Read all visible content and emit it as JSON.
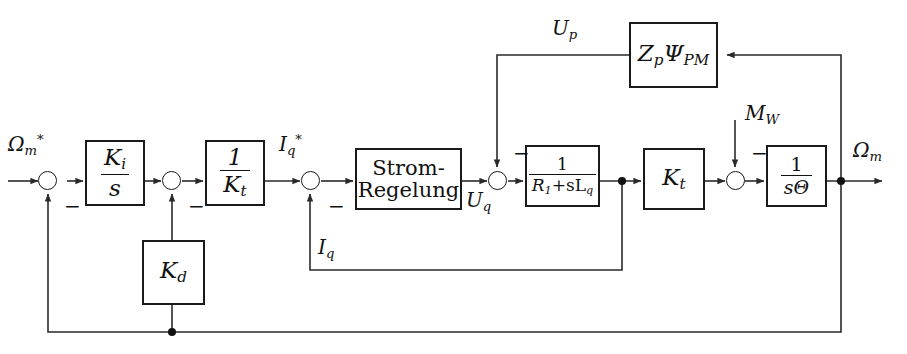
{
  "diagram": {
    "background_color": "#ffffff",
    "line_color": "#2a2a2a",
    "block_border_color": "#1a1a1a",
    "blocks": [
      {
        "id": "ki_s",
        "label": "K_i / s",
        "num": "K",
        "num_sub": "i",
        "den": "s",
        "type": "fraction"
      },
      {
        "id": "inv_kt",
        "label": "1 / K_t",
        "num": "1",
        "den": "K",
        "den_sub": "t",
        "type": "fraction"
      },
      {
        "id": "kd",
        "label": "K_d",
        "sym": "K",
        "sym_sub": "d",
        "type": "symbol"
      },
      {
        "id": "strom",
        "label": "Strom-Regelung",
        "line1": "Strom-",
        "line2": "Regelung",
        "type": "text"
      },
      {
        "id": "rl",
        "label": "1 / (R_1 + sL_q)",
        "num": "1",
        "den": "R",
        "den_sub": "1",
        "den_rest": "+sL",
        "den_sub2": "q",
        "type": "fraction"
      },
      {
        "id": "kt",
        "label": "K_t",
        "sym": "K",
        "sym_sub": "t",
        "type": "symbol"
      },
      {
        "id": "stheta",
        "label": "1 / (sΘ)",
        "num": "1",
        "den": "sΘ",
        "type": "fraction"
      },
      {
        "id": "zppm",
        "label": "Z_p Ψ_PM",
        "sym1": "Z",
        "sym1_sub": "p",
        "sym2": "Ψ",
        "sym2_sub": "PM",
        "type": "symbol2"
      }
    ],
    "signals": [
      {
        "id": "omega_ref",
        "base": "Ω",
        "sub": "m",
        "sup": "*",
        "label": "Ω_m*"
      },
      {
        "id": "iq_ref",
        "base": "I",
        "sub": "q",
        "sup": "*",
        "label": "I_q*"
      },
      {
        "id": "uq",
        "base": "U",
        "sub": "q",
        "sup": "",
        "label": "U_q"
      },
      {
        "id": "iq",
        "base": "I",
        "sub": "q",
        "sup": "",
        "label": "I_q"
      },
      {
        "id": "up",
        "base": "U",
        "sub": "p",
        "sup": "",
        "label": "U_p"
      },
      {
        "id": "mw",
        "base": "M",
        "sub": "W",
        "sup": "",
        "label": "M_W"
      },
      {
        "id": "omega_out",
        "base": "Ω",
        "sub": "m",
        "sup": "",
        "label": "Ω_m"
      }
    ],
    "sum_signs": [
      {
        "id": "sign-speed-fb",
        "symbol": "−"
      },
      {
        "id": "sign-damping",
        "symbol": "−"
      },
      {
        "id": "sign-current-fb",
        "symbol": "−"
      },
      {
        "id": "sign-emf",
        "symbol": "−"
      },
      {
        "id": "sign-load",
        "symbol": "−"
      }
    ]
  }
}
